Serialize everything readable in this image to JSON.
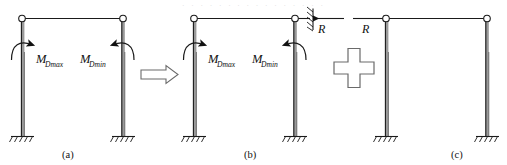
{
  "figure": {
    "type": "structural-engineering-diagram",
    "panels": [
      {
        "id": "a",
        "caption": "(a)",
        "joints": [
          "pin-circle-left",
          "pin-circle-right"
        ],
        "supports": [
          "fixed-base-left",
          "fixed-base-right"
        ],
        "moment_labels": [
          {
            "name": "M-Dmax",
            "base": "M",
            "sub": "Dmax",
            "side": "left"
          },
          {
            "name": "M-Dmin",
            "base": "M",
            "sub": "Dmin",
            "side": "right"
          }
        ]
      },
      {
        "id": "b",
        "caption": "(b)",
        "joints": [
          "pin-circle-left",
          "pin-circle-right"
        ],
        "supports": [
          "fixed-base-left",
          "fixed-base-right",
          "hatched-roller-right"
        ],
        "moment_labels": [
          {
            "name": "M-Dmax",
            "base": "M",
            "sub": "Dmax",
            "side": "left"
          },
          {
            "name": "M-Dmin",
            "base": "M",
            "sub": "Dmin",
            "side": "right"
          }
        ],
        "force_label": {
          "base": "R",
          "direction": "left"
        }
      },
      {
        "id": "c",
        "caption": "(c)",
        "joints": [
          "pin-circle-left",
          "pin-circle-right"
        ],
        "supports": [
          "fixed-base-left",
          "fixed-base-right"
        ],
        "moment_labels": [],
        "force_label": {
          "base": "R",
          "direction": "right"
        }
      }
    ],
    "operators": [
      {
        "name": "implies-arrow",
        "glyph": "⟹",
        "between": [
          "a",
          "b"
        ]
      },
      {
        "name": "plus-sign",
        "glyph": "+",
        "between": [
          "b",
          "c"
        ]
      }
    ],
    "colors": {
      "line": "#1a1a1a",
      "column_fill": "#9a9a9a",
      "operator_outline": "#6a6a6a",
      "background": "#ffffff"
    },
    "top_artifact_text": "· · · · · · · · · · · · · · · ·"
  }
}
